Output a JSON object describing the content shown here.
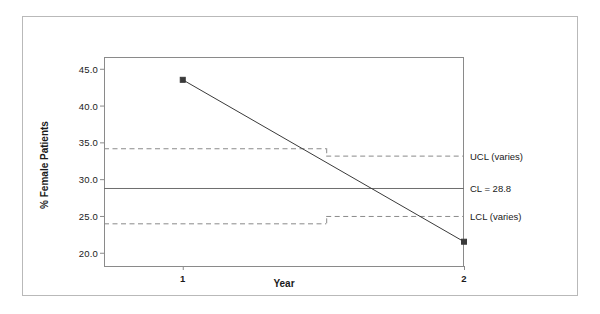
{
  "chart_data": {
    "type": "line",
    "title": "",
    "xlabel": "Year",
    "ylabel": "% Female Patients",
    "x": [
      1,
      2
    ],
    "categories": [
      "1",
      "2"
    ],
    "xlim": [
      0.72,
      2.0
    ],
    "ylim": [
      18.2,
      46.6
    ],
    "grid": false,
    "legend_position": "right-annotations",
    "series": [
      {
        "name": "% Female Patients",
        "values": [
          43.5,
          21.5
        ],
        "marker": "filled-square",
        "color": "#3a3a3a"
      }
    ],
    "control_limits": {
      "center_line": {
        "label": "CL = 28.8",
        "value": 28.8,
        "style": "solid",
        "color": "#6e6e6e"
      },
      "upper_control_limit": {
        "label": "UCL (varies)",
        "style": "dashed",
        "color": "#8a8a8a",
        "segments": [
          {
            "x_start": 0.72,
            "x_end": 1.51,
            "value": 34.2
          },
          {
            "x_start": 1.51,
            "x_end": 2.0,
            "value": 33.2
          }
        ]
      },
      "lower_control_limit": {
        "label": "LCL (varies)",
        "style": "dashed",
        "color": "#8a8a8a",
        "segments": [
          {
            "x_start": 0.72,
            "x_end": 1.51,
            "value": 24.0
          },
          {
            "x_start": 1.51,
            "x_end": 2.0,
            "value": 25.0
          }
        ]
      }
    },
    "y_ticks": [
      {
        "value": 45.0,
        "label": "45.0"
      },
      {
        "value": 40.0,
        "label": "40.0"
      },
      {
        "value": 35.0,
        "label": "35.0"
      },
      {
        "value": 30.0,
        "label": "30.0"
      },
      {
        "value": 25.0,
        "label": "25.0"
      },
      {
        "value": 20.0,
        "label": "20.0"
      }
    ],
    "x_ticks": [
      {
        "value": 1,
        "label": "1"
      },
      {
        "value": 2,
        "label": "2"
      }
    ],
    "annotations": [
      {
        "name": "ucl-annotation",
        "text": "UCL (varies)",
        "value": 33.2
      },
      {
        "name": "cl-annotation",
        "text": "CL = 28.8",
        "value": 28.8
      },
      {
        "name": "lcl-annotation",
        "text": "LCL (varies)",
        "value": 25.0
      }
    ]
  },
  "colors": {
    "background": "#ffffff",
    "frame": "#b9b9b9",
    "axis": "#8a8a8a",
    "series": "#3a3a3a",
    "center_line": "#6e6e6e",
    "control_limit": "#8a8a8a",
    "text": "#1a1a1a"
  }
}
